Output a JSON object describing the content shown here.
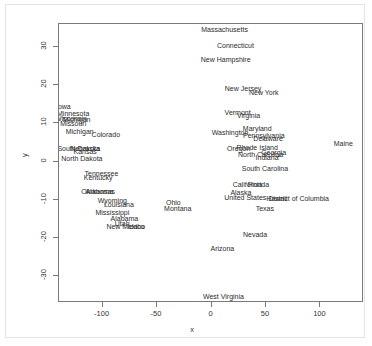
{
  "axes": {
    "x_title": "x",
    "y_title": "y",
    "x_ticks": [
      "-100",
      "-50",
      "0",
      "50",
      "100"
    ],
    "y_ticks": [
      "30",
      "20",
      "10",
      "0",
      "-10",
      "-20",
      "-30"
    ]
  },
  "chart_data": {
    "type": "scatter",
    "title": "",
    "xlabel": "x",
    "ylabel": "y",
    "xlim": [
      -140,
      140
    ],
    "ylim": [
      -37,
      36
    ],
    "grid": false,
    "legend": null,
    "marker": "text-label",
    "note": "Each data point is drawn as its state name text label instead of a plotting symbol; several labels overlap.",
    "labels_clipped_at_panel_edge": [
      "District of Columbia"
    ],
    "points": [
      {
        "label": "Massachusetts",
        "x": 12,
        "y": 34.5
      },
      {
        "label": "Connecticut",
        "x": 22,
        "y": 30.3
      },
      {
        "label": "New Hampshire",
        "x": 13,
        "y": 26.6
      },
      {
        "label": "New Jersey",
        "x": 29,
        "y": 19.1
      },
      {
        "label": "New York",
        "x": 48,
        "y": 17.9
      },
      {
        "label": "Iowa",
        "x": -136,
        "y": 14.3
      },
      {
        "label": "Minnesota",
        "x": -127,
        "y": 12.4
      },
      {
        "label": "Wisconsin",
        "x": -129,
        "y": 11.2
      },
      {
        "label": "Michigan",
        "x": -124,
        "y": 11.0
      },
      {
        "label": "Vermont",
        "x": 24,
        "y": 12.6
      },
      {
        "label": "Virginia",
        "x": 34,
        "y": 12.0
      },
      {
        "label": "Missouri",
        "x": -127,
        "y": 9.9
      },
      {
        "label": "Michigan ",
        "x": -121,
        "y": 7.7
      },
      {
        "label": "Maryland",
        "x": 42,
        "y": 8.5
      },
      {
        "label": "Washington",
        "x": 17,
        "y": 7.4
      },
      {
        "label": "Pennsylvania",
        "x": 48,
        "y": 6.6
      },
      {
        "label": "Colorado",
        "x": -97,
        "y": 6.9
      },
      {
        "label": "Delaware",
        "x": 52,
        "y": 5.8
      },
      {
        "label": "Maine",
        "x": 121,
        "y": 4.6
      },
      {
        "label": "Rhode Island",
        "x": 42,
        "y": 3.6
      },
      {
        "label": "Oregon",
        "x": 25,
        "y": 3.4
      },
      {
        "label": "South Dakota",
        "x": -122,
        "y": 3.3
      },
      {
        "label": "Nebraska",
        "x": -116,
        "y": 3.3
      },
      {
        "label": "Kansas",
        "x": -116,
        "y": 2.4
      },
      {
        "label": "Georgia",
        "x": 57,
        "y": 2.3
      },
      {
        "label": "North Carolina",
        "x": 45,
        "y": 1.7
      },
      {
        "label": "Indiana",
        "x": 51,
        "y": 0.9
      },
      {
        "label": "North Dakota",
        "x": -119,
        "y": 0.7
      },
      {
        "label": "South Carolina",
        "x": 49,
        "y": -1.9
      },
      {
        "label": "Tennessee",
        "x": -101,
        "y": -3.3
      },
      {
        "label": "Kentucky",
        "x": -104,
        "y": -4.2
      },
      {
        "label": "California",
        "x": 33,
        "y": -6.2
      },
      {
        "label": "Florida",
        "x": 43,
        "y": -6.2
      },
      {
        "label": "Oklahoma",
        "x": -105,
        "y": -7.9
      },
      {
        "label": "Arkansas",
        "x": -102,
        "y": -8.0
      },
      {
        "label": "Alaska",
        "x": 27,
        "y": -8.2
      },
      {
        "label": "United States",
        "x": 31,
        "y": -9.4
      },
      {
        "label": "Hawaii",
        "x": 60,
        "y": -9.7
      },
      {
        "label": "District of Columbia",
        "x": 80,
        "y": -9.7
      },
      {
        "label": "Wyoming",
        "x": -91,
        "y": -10.4
      },
      {
        "label": "Louisiana",
        "x": -85,
        "y": -11.3
      },
      {
        "label": "Ohio",
        "x": -35,
        "y": -10.8
      },
      {
        "label": "Texas",
        "x": 49,
        "y": -12.3
      },
      {
        "label": "Montana",
        "x": -31,
        "y": -12.3
      },
      {
        "label": "Mississippi",
        "x": -91,
        "y": -13.4
      },
      {
        "label": "Alabama",
        "x": -80,
        "y": -15.1
      },
      {
        "label": "Utah",
        "x": -82,
        "y": -16.4
      },
      {
        "label": "New Mexico",
        "x": -79,
        "y": -17.2
      },
      {
        "label": "Idaho",
        "x": -69,
        "y": -17.2
      },
      {
        "label": "Nevada",
        "x": 40,
        "y": -19.1
      },
      {
        "label": "Arizona",
        "x": 10,
        "y": -23.0
      },
      {
        "label": "West Virginia",
        "x": 11,
        "y": -35.5
      }
    ]
  }
}
